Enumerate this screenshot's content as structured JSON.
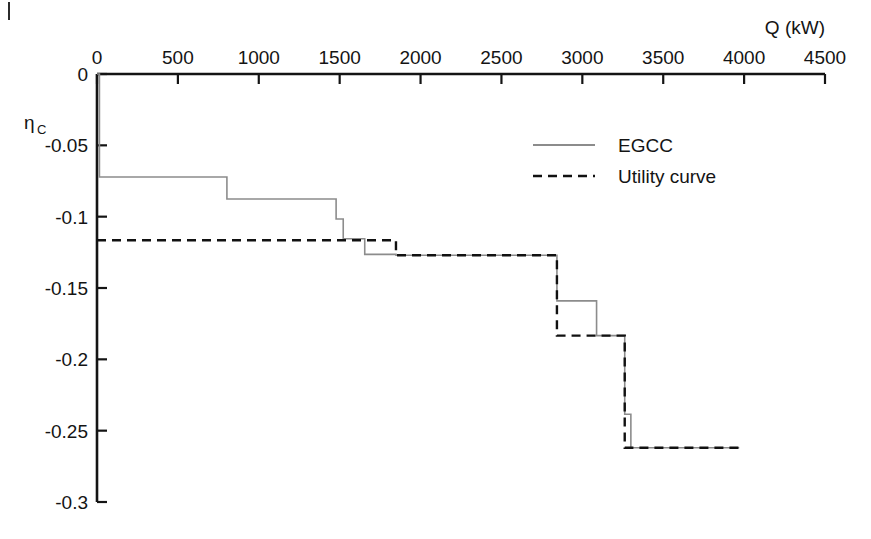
{
  "figure": {
    "corner_mark": "|",
    "background_color": "#ffffff"
  },
  "chart_data": {
    "type": "line",
    "title": "",
    "subtitle": "",
    "xlabel": "Q (kW)",
    "ylabel": "ηc",
    "ylabel_main": "η",
    "ylabel_subscript": "C",
    "xlim": [
      0,
      4500
    ],
    "ylim": [
      -0.3,
      0
    ],
    "xticks": [
      0,
      500,
      1000,
      1500,
      2000,
      2500,
      3000,
      3500,
      4000,
      4500
    ],
    "xtick_labels": [
      "0",
      "500",
      "1000",
      "1500",
      "2000",
      "2500",
      "3000",
      "3500",
      "4000",
      "4500"
    ],
    "yticks": [
      0,
      -0.05,
      -0.1,
      -0.15,
      -0.2,
      -0.25,
      -0.3
    ],
    "ytick_labels": [
      "0",
      "-0.05",
      "-0.1",
      "-0.15",
      "-0.2",
      "-0.25",
      "-0.3"
    ],
    "grid": false,
    "x_axis_position": "top",
    "legend_position": "upper-right-inside",
    "series": [
      {
        "name": "EGCC",
        "style": "solid",
        "color": "#8c8c8c",
        "line_width": 1.6,
        "points": [
          [
            0,
            0
          ],
          [
            15,
            0
          ],
          [
            15,
            -0.0722
          ],
          [
            803,
            -0.0722
          ],
          [
            803,
            -0.0876
          ],
          [
            1478,
            -0.0876
          ],
          [
            1478,
            -0.1016
          ],
          [
            1522,
            -0.1016
          ],
          [
            1522,
            -0.1155
          ],
          [
            1655,
            -0.1155
          ],
          [
            1655,
            -0.1264
          ],
          [
            1848,
            -0.1264
          ],
          [
            1848,
            -0.127
          ],
          [
            2843,
            -0.127
          ],
          [
            2843,
            -0.159
          ],
          [
            3088,
            -0.159
          ],
          [
            3088,
            -0.1834
          ],
          [
            3262,
            -0.1834
          ],
          [
            3262,
            -0.2385
          ],
          [
            3300,
            -0.2385
          ],
          [
            3300,
            -0.262
          ],
          [
            3970,
            -0.262
          ]
        ]
      },
      {
        "name": "Utility curve",
        "style": "dashed",
        "color": "#111111",
        "line_width": 2.4,
        "dash_pattern": "9,6",
        "points": [
          [
            0,
            -0.1165
          ],
          [
            1848,
            -0.1165
          ],
          [
            1848,
            -0.127
          ],
          [
            2843,
            -0.127
          ],
          [
            2843,
            -0.1834
          ],
          [
            3262,
            -0.1834
          ],
          [
            3262,
            -0.262
          ],
          [
            3970,
            -0.262
          ]
        ]
      }
    ],
    "legend": [
      {
        "label": "EGCC",
        "style": "solid",
        "color": "#8c8c8c"
      },
      {
        "label": "Utility curve",
        "style": "dashed",
        "color": "#111111"
      }
    ],
    "annotations": []
  }
}
